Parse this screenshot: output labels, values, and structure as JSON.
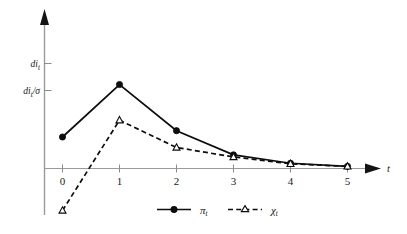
{
  "chart_data": {
    "type": "line",
    "title": "",
    "subtitle": "",
    "xlabel": "t",
    "ylabel": "",
    "x": [
      0,
      1,
      2,
      3,
      4,
      5
    ],
    "xticklabels": [
      "0",
      "1",
      "2",
      "3",
      "4",
      "5"
    ],
    "xlim": [
      0,
      5
    ],
    "ylim": [
      -0.28,
      1.55
    ],
    "grid": false,
    "legend_position": "bottom-center",
    "yticklabels": [
      "di_t",
      "di_t/σ"
    ],
    "yticks": [
      1.45,
      1.0
    ],
    "series": [
      {
        "name": "π_t",
        "legend_label": "π",
        "legend_subscript": "t",
        "marker": "filled-circle",
        "linestyle": "solid",
        "color": "#0d0d0d",
        "values": [
          0.3,
          0.8,
          0.36,
          0.13,
          0.05,
          0.02
        ]
      },
      {
        "name": "χ_t",
        "legend_label": "χ",
        "legend_subscript": "t",
        "marker": "open-triangle",
        "linestyle": "dashed",
        "color": "#0d0d0d",
        "values": [
          -0.4,
          0.46,
          0.2,
          0.11,
          0.045,
          0.02
        ]
      }
    ],
    "annotations": []
  },
  "yaxis": {
    "labels": [
      {
        "base": "di",
        "subscript": "t",
        "suffix": ""
      },
      {
        "base": "di",
        "subscript": "t",
        "suffix": "/σ"
      }
    ]
  },
  "xaxis": {
    "name": "t",
    "ticks": [
      "0",
      "1",
      "2",
      "3",
      "4",
      "5"
    ]
  },
  "legend": {
    "entries": [
      {
        "symbol_base": "π",
        "symbol_sub": "t",
        "style": "solid-filled-circle"
      },
      {
        "symbol_base": "χ",
        "symbol_sub": "t",
        "style": "dashed-open-triangle"
      }
    ]
  }
}
